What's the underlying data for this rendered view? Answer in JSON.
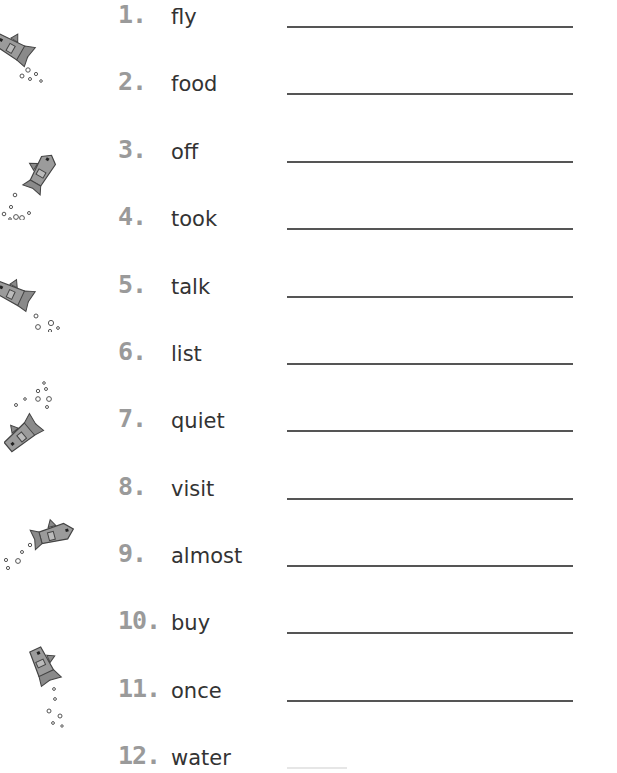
{
  "worksheet": {
    "items": [
      {
        "number": "1.",
        "word": "fly"
      },
      {
        "number": "2.",
        "word": "food"
      },
      {
        "number": "3.",
        "word": "off"
      },
      {
        "number": "4.",
        "word": "took"
      },
      {
        "number": "5.",
        "word": "talk"
      },
      {
        "number": "6.",
        "word": "list"
      },
      {
        "number": "7.",
        "word": "quiet"
      },
      {
        "number": "8.",
        "word": "visit"
      },
      {
        "number": "9.",
        "word": "almost"
      },
      {
        "number": "10.",
        "word": "buy"
      },
      {
        "number": "11.",
        "word": "once"
      },
      {
        "number": "12.",
        "word": "water"
      }
    ]
  },
  "decorations": {
    "fish_icons": [
      "fish-icon",
      "fish-icon",
      "fish-icon",
      "fish-icon",
      "fish-icon",
      "fish-icon"
    ]
  },
  "colors": {
    "number": "#9a9a9a",
    "word": "#333333",
    "line": "#555555",
    "fish": "#9b9b9b"
  }
}
